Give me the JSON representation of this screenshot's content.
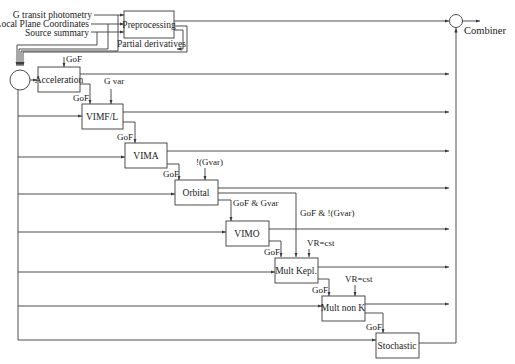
{
  "inputs": {
    "transit": "G transit photometry",
    "local_plane": "Local Plane Coordinates",
    "source_summary": "Source summary"
  },
  "blocks": {
    "preprocessing": "Preprocessing",
    "acceleration": "Acceleration",
    "vimfl": "VIMF/L",
    "vima": "VIMA",
    "orbital": "Orbital",
    "vimo": "VIMO",
    "mult_kepl": "Mult Kepl.",
    "mult_non_k": "Mult non K",
    "stochastic": "Stochastic"
  },
  "labels": {
    "partial_derivatives": "Partial derivatives",
    "combiner": "Combiner",
    "gof_acc": "GoF",
    "gof_vimfl": "GoF",
    "g_var": "G var",
    "gof_vima": "GoF",
    "not_gvar": "!(Gvar)",
    "gof_orbital": "GoF",
    "gof_and_gvar": "GoF & Gvar",
    "gof_and_not_gvar": "GoF & !(Gvar)",
    "gof_multkepl": "GoF",
    "vr_cst_1": "VR=cst",
    "gof_multnonk": "GoF",
    "vr_cst_2": "VR=cst",
    "gof_stochastic": "GoF"
  },
  "colors": {
    "line": "#3a3a3a",
    "text": "#222222",
    "background": "#ffffff"
  }
}
